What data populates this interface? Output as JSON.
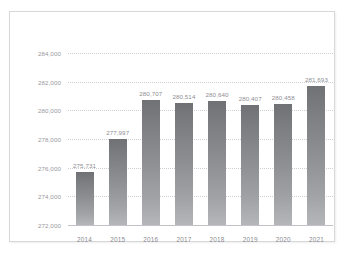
{
  "chart_data": {
    "type": "bar",
    "title": "",
    "subtitle": "",
    "xlabel": "",
    "ylabel": "",
    "categories": [
      "2014",
      "2015",
      "2016",
      "2017",
      "2018",
      "2019",
      "2020",
      "2021"
    ],
    "values": [
      275731,
      277997,
      280707,
      280514,
      280640,
      280407,
      280458,
      281693
    ],
    "value_labels": [
      "275,731",
      "277,997",
      "280,707",
      "280,514",
      "280,640",
      "280,407",
      "280,458",
      "281,693"
    ],
    "ylim": [
      272000,
      284000
    ],
    "ytick_values": [
      272000,
      274000,
      276000,
      278000,
      280000,
      282000,
      284000
    ],
    "ytick_labels": [
      "272,000",
      "274,000",
      "276,000",
      "278,000",
      "280,000",
      "282,000",
      "284,000"
    ],
    "ytick_step": 2000,
    "grid": true,
    "grid_style": "dotted",
    "legend": false,
    "legend_position": "none",
    "data_labels_shown": true,
    "series": [
      {
        "name": "",
        "values": [
          275731,
          277997,
          280707,
          280514,
          280640,
          280407,
          280458,
          281693
        ]
      }
    ]
  },
  "style": {
    "bar_color_top": "#6f7175",
    "bar_color_bottom": "#b4b6ba",
    "grid_color": "#cfcfd4",
    "axis_color": "#c2c2c6",
    "label_color": "#8e8e94",
    "tick_color": "#9a9aa0",
    "frame_color": "#d8d8d8",
    "background": "#ffffff"
  }
}
